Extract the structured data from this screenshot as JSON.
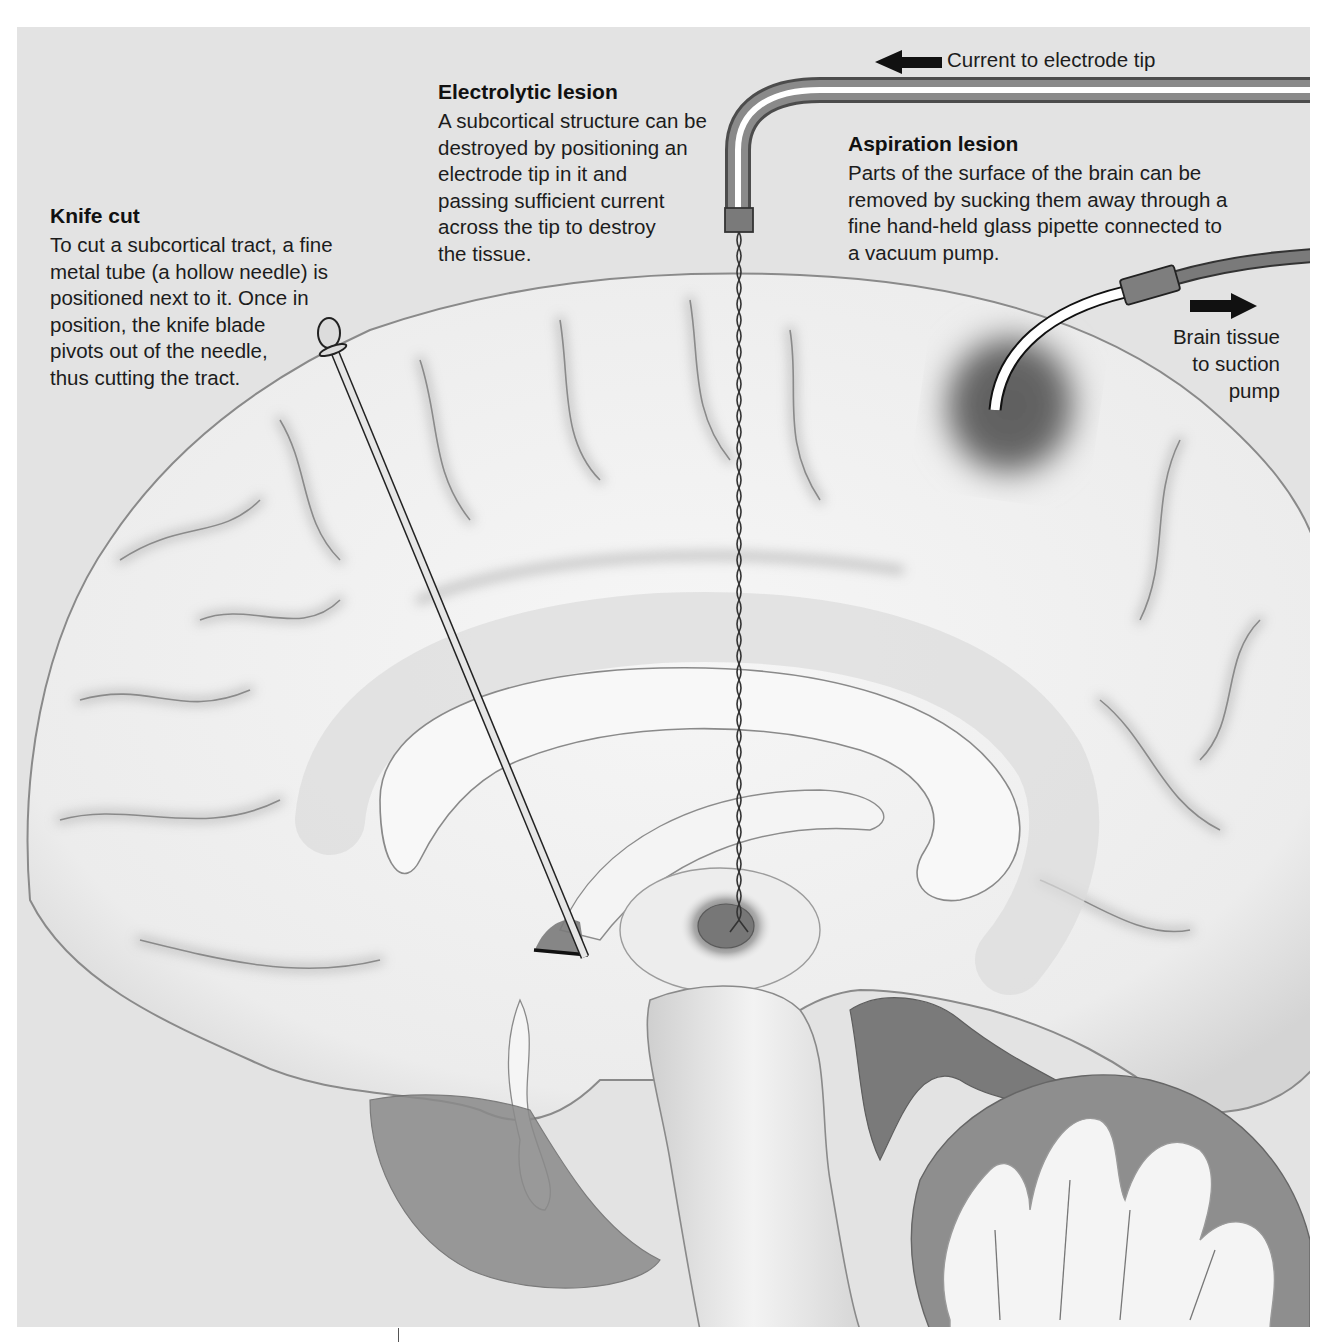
{
  "figure": {
    "colors": {
      "page_background": "#ffffff",
      "panel_background": "#e3e3e3",
      "brain_surface": "#f1f1f1",
      "sulcus_shadow": "#bdbdbd",
      "white_matter": "#f7f7f7",
      "ventricle_dark": "#6f6f6f",
      "lesion_dark": "#5a5a5a",
      "text": "#1a1a1a"
    }
  },
  "labels": {
    "knife_cut": {
      "title": "Knife cut",
      "lines": [
        "To cut a subcortical tract, a fine",
        "metal tube (a hollow needle) is",
        "positioned next to it. Once in",
        "position, the knife blade",
        "pivots out of the needle,",
        "thus cutting the tract."
      ]
    },
    "electrolytic_lesion": {
      "title": "Electrolytic lesion",
      "lines": [
        "A subcortical structure can be",
        "destroyed by positioning an",
        "electrode tip in it and",
        "passing sufficient current",
        "across the tip to destroy",
        "the tissue."
      ]
    },
    "aspiration_lesion": {
      "title": "Aspiration lesion",
      "lines": [
        "Parts of the surface of the brain can be",
        "removed by sucking them away through a",
        "fine hand-held glass pipette connected to",
        "a vacuum pump."
      ]
    },
    "current_arrow": {
      "text": "Current to electrode tip",
      "direction": "left"
    },
    "suction_arrow": {
      "lines": [
        "Brain tissue",
        "to suction",
        "pump"
      ],
      "direction": "right"
    }
  },
  "instruments": [
    {
      "name": "knife-needle",
      "description": "Hollow needle with pivoting knife blade, inserted diagonally toward subcortical tract"
    },
    {
      "name": "electrode",
      "description": "Insulated electrode with twisted wire descending vertically to subcortical target"
    },
    {
      "name": "aspiration-pipette",
      "description": "Curved glass pipette on cortical surface connected to vacuum tubing"
    }
  ],
  "lesion_sites": [
    {
      "name": "knife-cut-site",
      "description": "Dark wedge where blade cuts tract near anterior commissure region"
    },
    {
      "name": "electrolytic-site",
      "description": "Dark oval lesion in thalamus at electrode tip"
    },
    {
      "name": "aspiration-site",
      "description": "Dark square region of removed cortex on dorsal surface"
    }
  ]
}
